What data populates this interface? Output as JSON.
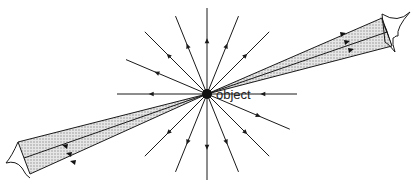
{
  "diagram": {
    "type": "optics-ray-diagram",
    "object_label": "object",
    "center": [
      207,
      94
    ],
    "line_color": "#1a1a1a",
    "beam_fill": "#cfcfcf",
    "rays": [
      {
        "angle": 180,
        "len": 90,
        "arrow": "out"
      },
      {
        "angle": 0,
        "len": 90,
        "arrow": "in"
      },
      {
        "angle": -90,
        "len": 86,
        "arrow": "out"
      },
      {
        "angle": -112,
        "len": 84,
        "arrow": "out"
      },
      {
        "angle": -68,
        "len": 84,
        "arrow": "out"
      },
      {
        "angle": -135,
        "len": 88,
        "arrow": "out"
      },
      {
        "angle": -45,
        "len": 88,
        "arrow": "out"
      },
      {
        "angle": -157,
        "len": 88,
        "arrow": "out"
      },
      {
        "angle": 90,
        "len": 86,
        "arrow": "out"
      },
      {
        "angle": 112,
        "len": 84,
        "arrow": "out"
      },
      {
        "angle": 68,
        "len": 84,
        "arrow": "out"
      },
      {
        "angle": 135,
        "len": 88,
        "arrow": "out"
      },
      {
        "angle": 45,
        "len": 88,
        "arrow": "out"
      },
      {
        "angle": 23,
        "len": 90,
        "arrow": "out"
      }
    ],
    "eyes": [
      {
        "name": "right-eye",
        "x": 392,
        "y": 28
      },
      {
        "name": "left-eye",
        "x": 22,
        "y": 165
      }
    ]
  }
}
